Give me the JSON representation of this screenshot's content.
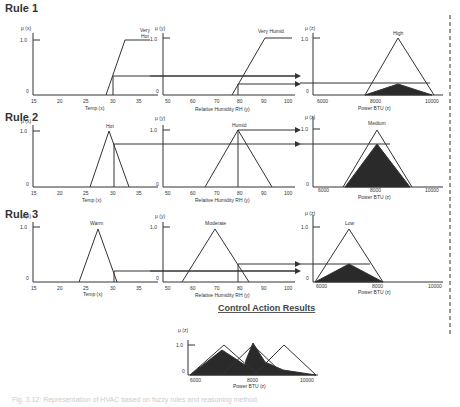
{
  "rules": [
    {
      "label": "Rule 1",
      "temp_set": "Very Hot",
      "humidity_set": "Very Humid",
      "power_set": "High"
    },
    {
      "label": "Rule 2",
      "temp_set": "Hot",
      "humidity_set": "Humid",
      "power_set": "Medium"
    },
    {
      "label": "Rule 3",
      "temp_set": "Warm",
      "humidity_set": "Moderate",
      "power_set": "Low"
    }
  ],
  "axes": {
    "temp": {
      "ylabel": "μ (x)",
      "xlabel": "Temp (x)",
      "ticks": [
        "15",
        "20",
        "25",
        "30",
        "35"
      ],
      "y_ticks": [
        "1.0",
        "0"
      ]
    },
    "humidity": {
      "ylabel": "μ (y)",
      "xlabel": "Relative Humidity RH (y)",
      "ticks": [
        "50",
        "60",
        "70",
        "80",
        "90",
        "100"
      ],
      "y_ticks": [
        "1.0",
        "0"
      ]
    },
    "power": {
      "ylabel": "μ (z)",
      "xlabel": "Power BTU (z)",
      "ticks": [
        "6000",
        "8000",
        "10000"
      ],
      "y_ticks": [
        "1.0",
        "0"
      ]
    }
  },
  "result": {
    "title": "Control Action Results",
    "ylabel": "μ (z)",
    "xlabel": "Power BTU (z)",
    "ticks": [
      "6000",
      "8000",
      "10000"
    ],
    "y_ticks": [
      "1.0",
      "0"
    ]
  },
  "caption": "Fig. 3.12: Representation of HVAC based on fuzzy rules and reasoning method.",
  "colors": {
    "line": "#333333",
    "fill": "#2a2a2a"
  }
}
